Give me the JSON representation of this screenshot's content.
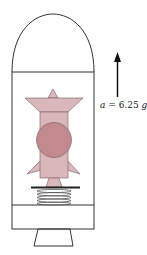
{
  "diagram": {
    "title": "",
    "acceleration_label": {
      "variable": "a",
      "equals": " = ",
      "value": "6.25",
      "unit": "g"
    },
    "arrow_direction": "up",
    "components": [
      "nose-cone",
      "rocket-body",
      "payload-compartment",
      "figure-on-scale",
      "spring-scale",
      "lower-compartment",
      "nozzle"
    ],
    "colors": {
      "outline": "#333333",
      "figure_fill_light": "#d9b8bb",
      "figure_fill_head": "#c28a8e",
      "figure_outline": "#7a5a5c",
      "spring": "#555555",
      "platform": "#222222"
    }
  }
}
